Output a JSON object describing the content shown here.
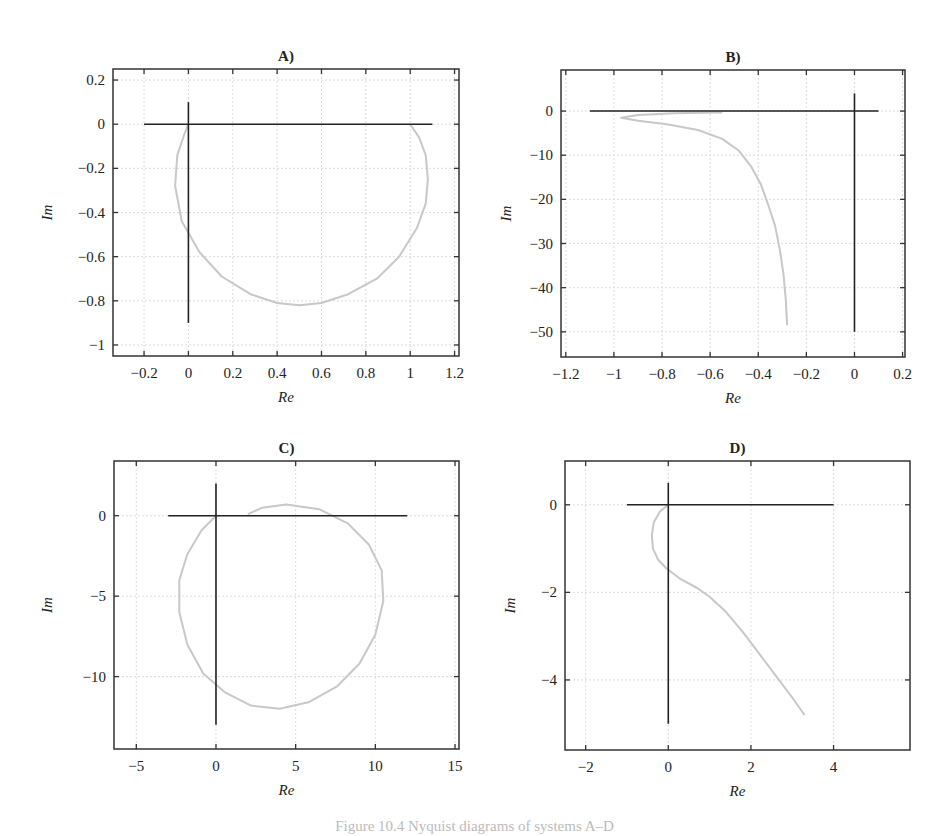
{
  "figure": {
    "caption": "Figure 10.4 Nyquist diagrams of systems A–D"
  },
  "chart_data": [
    {
      "type": "line",
      "title": "A)",
      "xlabel": "Re",
      "ylabel": "Im",
      "xlim": [
        -0.34,
        1.22
      ],
      "ylim": [
        -1.05,
        0.25
      ],
      "xticks": [
        -0.2,
        0,
        0.2,
        0.4,
        0.6,
        0.8,
        1,
        1.2
      ],
      "xtick_labels": [
        "−0.2",
        "0",
        "0.2",
        "0.4",
        "0.6",
        "0.8",
        "1",
        "1.2"
      ],
      "yticks": [
        0.2,
        0,
        -0.2,
        -0.4,
        -0.6,
        -0.8,
        -1
      ],
      "ytick_labels": [
        "0.2",
        "0",
        "−0.2",
        "−0.4",
        "−0.6",
        "−0.8",
        "−1"
      ],
      "grid": true,
      "axes_lines": {
        "h": {
          "x": [
            -0.2,
            1.1
          ],
          "y": 0
        },
        "v": {
          "x": 0,
          "y": [
            -0.9,
            0.1
          ]
        }
      },
      "series": [
        {
          "name": "nyquist",
          "color": "#c8c8c8",
          "x": [
            1.0,
            1.04,
            1.07,
            1.08,
            1.07,
            1.03,
            0.95,
            0.85,
            0.72,
            0.6,
            0.5,
            0.4,
            0.28,
            0.15,
            0.05,
            -0.03,
            -0.06,
            -0.05,
            -0.02,
            0.0
          ],
          "y": [
            0.0,
            -0.06,
            -0.14,
            -0.25,
            -0.36,
            -0.47,
            -0.6,
            -0.7,
            -0.77,
            -0.81,
            -0.82,
            -0.81,
            -0.77,
            -0.69,
            -0.58,
            -0.44,
            -0.28,
            -0.14,
            -0.05,
            0.0
          ]
        }
      ]
    },
    {
      "type": "line",
      "title": "B)",
      "xlabel": "Re",
      "ylabel": "Im",
      "xlim": [
        -1.22,
        0.21
      ],
      "ylim": [
        -55.7,
        9.3
      ],
      "xticks": [
        -1.2,
        -1,
        -0.8,
        -0.6,
        -0.4,
        -0.2,
        0,
        0.2
      ],
      "xtick_labels": [
        "−1.2",
        "−1",
        "−0.8",
        "−0.6",
        "−0.4",
        "−0.2",
        "0",
        "0.2"
      ],
      "yticks": [
        0,
        -10,
        -20,
        -30,
        -40,
        -50
      ],
      "ytick_labels": [
        "0",
        "−10",
        "−20",
        "−30",
        "−40",
        "−50"
      ],
      "grid": true,
      "axes_lines": {
        "h": {
          "x": [
            -1.1,
            0.1
          ],
          "y": 0
        },
        "v": {
          "x": 0,
          "y": [
            -50,
            4
          ]
        }
      },
      "series": [
        {
          "name": "nyquist",
          "color": "#c8c8c8",
          "x": [
            -0.55,
            -0.75,
            -0.9,
            -0.97,
            -0.9,
            -0.78,
            -0.65,
            -0.55,
            -0.48,
            -0.43,
            -0.39,
            -0.36,
            -0.33,
            -0.31,
            -0.295,
            -0.285,
            -0.28
          ],
          "y": [
            -0.3,
            -0.5,
            -0.9,
            -1.5,
            -2.2,
            -3.0,
            -4.3,
            -6.3,
            -9.0,
            -12.5,
            -16.5,
            -21.0,
            -26.0,
            -31.5,
            -37.0,
            -43.0,
            -48.5
          ]
        }
      ]
    },
    {
      "type": "line",
      "title": "C)",
      "xlabel": "Re",
      "ylabel": "Im",
      "xlim": [
        -6.4,
        15.25
      ],
      "ylim": [
        -14.5,
        3.4
      ],
      "xticks": [
        -5,
        0,
        5,
        10,
        15
      ],
      "xtick_labels": [
        "−5",
        "0",
        "5",
        "10",
        "15"
      ],
      "yticks": [
        0,
        -5,
        -10
      ],
      "ytick_labels": [
        "0",
        "−5",
        "−10"
      ],
      "grid": true,
      "axes_lines": {
        "h": {
          "x": [
            -3,
            12
          ],
          "y": 0
        },
        "v": {
          "x": 0,
          "y": [
            -13,
            2
          ]
        }
      },
      "series": [
        {
          "name": "nyquist",
          "color": "#c8c8c8",
          "x": [
            0.0,
            -0.9,
            -1.8,
            -2.3,
            -2.3,
            -1.8,
            -0.8,
            0.6,
            2.2,
            4.0,
            5.8,
            7.6,
            9.0,
            10.0,
            10.5,
            10.4,
            9.6,
            8.3,
            6.5,
            4.4,
            2.9,
            2.0
          ],
          "y": [
            0.0,
            -0.9,
            -2.4,
            -4.0,
            -6.0,
            -8.0,
            -9.8,
            -11.0,
            -11.8,
            -12.0,
            -11.6,
            -10.6,
            -9.2,
            -7.4,
            -5.3,
            -3.4,
            -1.8,
            -0.5,
            0.4,
            0.7,
            0.5,
            0.1
          ]
        }
      ]
    },
    {
      "type": "line",
      "title": "D)",
      "xlabel": "Re",
      "ylabel": "Im",
      "xlim": [
        -2.5,
        5.85
      ],
      "ylim": [
        -5.6,
        1.0
      ],
      "xticks": [
        -2,
        0,
        2,
        4
      ],
      "xtick_labels": [
        "−2",
        "0",
        "2",
        "4"
      ],
      "yticks": [
        0,
        -2,
        -4
      ],
      "ytick_labels": [
        "0",
        "−2",
        "−4"
      ],
      "grid": true,
      "axes_lines": {
        "h": {
          "x": [
            -1,
            4
          ],
          "y": 0
        },
        "v": {
          "x": 0,
          "y": [
            -5,
            0.5
          ]
        }
      },
      "series": [
        {
          "name": "nyquist",
          "color": "#c8c8c8",
          "x": [
            0.0,
            -0.2,
            -0.35,
            -0.4,
            -0.37,
            -0.25,
            -0.05,
            0.3,
            0.7,
            1.0,
            1.4,
            1.8,
            2.2,
            2.6,
            3.0,
            3.3
          ],
          "y": [
            0.0,
            -0.15,
            -0.4,
            -0.7,
            -1.0,
            -1.25,
            -1.45,
            -1.7,
            -1.9,
            -2.1,
            -2.45,
            -2.9,
            -3.4,
            -3.9,
            -4.4,
            -4.8
          ]
        }
      ]
    }
  ]
}
